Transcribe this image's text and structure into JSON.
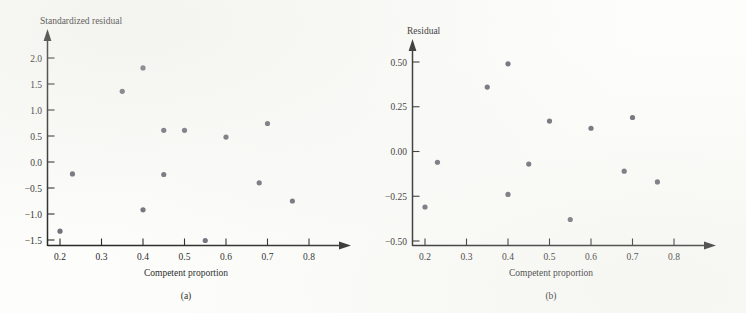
{
  "figure": {
    "background_color": "#fdfdfb",
    "dot_color": "#6e6e78",
    "axis_color": "#262626"
  },
  "panels": [
    {
      "id": "a",
      "caption": "(a)",
      "ylabel": "Standardized residual",
      "xlabel": "Competent proportion",
      "xticks": [
        "0.2",
        "0.3",
        "0.4",
        "0.5",
        "0.6",
        "0.7",
        "0.8"
      ],
      "yticks": [
        "2.0",
        "1.5",
        "1.0",
        "0.5",
        "0.0",
        "−0.5",
        "−1.0",
        "−1.5"
      ]
    },
    {
      "id": "b",
      "caption": "(b)",
      "ylabel": "Residual",
      "xlabel": "Competent proportion",
      "xticks": [
        "0.2",
        "0.3",
        "0.4",
        "0.5",
        "0.6",
        "0.7",
        "0.8"
      ],
      "yticks": [
        "0.50",
        "0.25",
        "0.00",
        "−0.25",
        "−0.50"
      ]
    }
  ],
  "chart_data": [
    {
      "type": "scatter",
      "panel": "(a)",
      "title": "",
      "xlabel": "Competent proportion",
      "ylabel": "Standardized residual",
      "xlim": [
        0.155,
        0.845
      ],
      "ylim": [
        -1.68,
        2.22
      ],
      "xticks": [
        0.2,
        0.3,
        0.4,
        0.5,
        0.6,
        0.7,
        0.8
      ],
      "yticks": [
        2.0,
        1.5,
        1.0,
        0.5,
        0.0,
        -0.5,
        -1.0,
        -1.5
      ],
      "grid": false,
      "legend": null,
      "x": [
        0.2,
        0.23,
        0.35,
        0.4,
        0.4,
        0.45,
        0.45,
        0.5,
        0.55,
        0.6,
        0.68,
        0.7,
        0.76
      ],
      "values": [
        -1.33,
        -0.23,
        1.36,
        1.81,
        -0.92,
        0.61,
        -0.24,
        0.61,
        -1.51,
        0.48,
        -0.4,
        0.74,
        -0.75
      ]
    },
    {
      "type": "scatter",
      "panel": "(b)",
      "title": "",
      "xlabel": "Competent proportion",
      "ylabel": "Residual",
      "xlim": [
        0.155,
        0.845
      ],
      "ylim": [
        -0.56,
        0.59
      ],
      "xticks": [
        0.2,
        0.3,
        0.4,
        0.5,
        0.6,
        0.7,
        0.8
      ],
      "yticks": [
        0.5,
        0.25,
        0.0,
        -0.25,
        -0.5
      ],
      "grid": false,
      "legend": null,
      "x": [
        0.2,
        0.23,
        0.35,
        0.4,
        0.4,
        0.45,
        0.5,
        0.55,
        0.6,
        0.68,
        0.7,
        0.76
      ],
      "values": [
        -0.31,
        -0.06,
        0.36,
        0.49,
        -0.24,
        -0.07,
        0.17,
        -0.38,
        0.13,
        -0.11,
        0.19,
        -0.17
      ]
    }
  ]
}
